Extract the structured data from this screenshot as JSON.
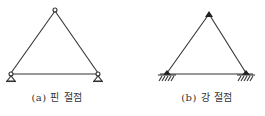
{
  "figures": [
    {
      "id": "a",
      "caption": "(a) 핀 절점",
      "joint_type": "pin",
      "vertices": {
        "apex": [
          55,
          10
        ],
        "left": [
          11,
          74
        ],
        "right": [
          98,
          74
        ]
      }
    },
    {
      "id": "b",
      "caption": "(b) 강 절점",
      "joint_type": "rigid",
      "vertices": {
        "apex": [
          209,
          13
        ],
        "left": [
          167,
          74
        ],
        "right": [
          246,
          74
        ]
      }
    }
  ],
  "colors": {
    "line": "#333333",
    "background": "#ffffff"
  }
}
